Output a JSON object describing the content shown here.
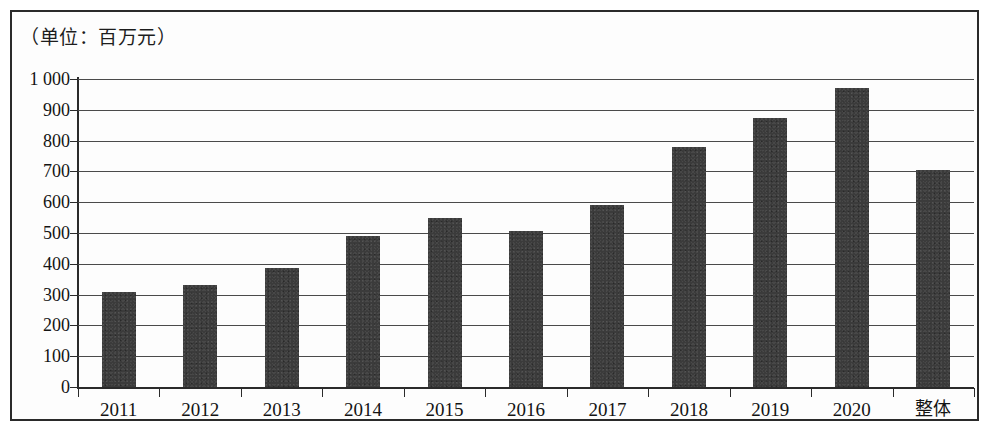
{
  "figure": {
    "unit_caption": "（单位：百万元）",
    "bar_color": "#3b3b3b",
    "axis_color": "#2b2b2b",
    "grid_color": "#4a4a4a",
    "background": "#ffffff"
  },
  "chart_data": {
    "type": "bar",
    "title": "",
    "subtitle": "",
    "annotations": [
      "（单位：百万元）"
    ],
    "xlabel": "",
    "ylabel": "",
    "unit": "百万元",
    "categories": [
      "2011",
      "2012",
      "2013",
      "2014",
      "2015",
      "2016",
      "2017",
      "2018",
      "2019",
      "2020",
      "整体"
    ],
    "values": [
      310,
      330,
      385,
      490,
      550,
      505,
      590,
      780,
      875,
      970,
      705
    ],
    "ylim": [
      0,
      1000
    ],
    "ytick_values": [
      0,
      100,
      200,
      300,
      400,
      500,
      600,
      700,
      800,
      900,
      1000
    ],
    "ytick_labels": [
      "0",
      "100",
      "200",
      "300",
      "400",
      "500",
      "600",
      "700",
      "800",
      "900",
      "1 000"
    ],
    "grid": true,
    "grid_axis": "y",
    "legend": false,
    "legend_position": "none"
  }
}
